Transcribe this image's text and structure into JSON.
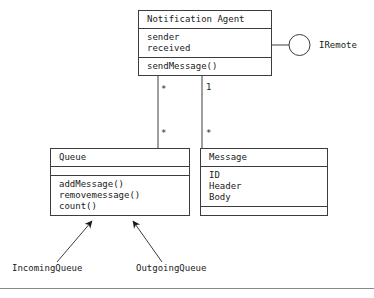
{
  "diagram": {
    "type": "uml-class-diagram",
    "background_color": "#ffffff",
    "line_color": "#3c3c3c",
    "text_color": "#1a1a1a"
  },
  "classes": [
    {
      "id": "notification-agent",
      "name": "Notification Agent",
      "attributes": [
        "sender",
        "received"
      ],
      "operations": [
        "sendMessage()"
      ]
    },
    {
      "id": "queue",
      "name": "Queue",
      "attributes": [],
      "operations": [
        "addMessage()",
        "removemessage()",
        "count()"
      ]
    },
    {
      "id": "message",
      "name": "Message",
      "attributes": [
        "ID",
        "Header",
        "Body"
      ],
      "operations": []
    }
  ],
  "interface": {
    "name": "IRemote",
    "notation": "lollipop-provided-interface"
  },
  "subclasses": [
    {
      "id": "incoming-queue",
      "name": "IncomingQueue",
      "parent": "Queue"
    },
    {
      "id": "outgoing-queue",
      "name": "OutgoingQueue",
      "parent": "Queue"
    }
  ],
  "associations": [
    {
      "id": "agent-queue",
      "from": "Notification Agent",
      "to": "Queue",
      "source_multiplicity": "*",
      "target_multiplicity": "*"
    },
    {
      "id": "agent-message",
      "from": "Notification Agent",
      "to": "Message",
      "source_multiplicity": "1",
      "target_multiplicity": "*"
    }
  ]
}
